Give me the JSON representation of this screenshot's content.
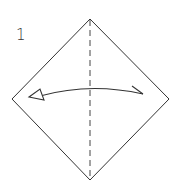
{
  "diagram": {
    "step_number": "1",
    "paper": {
      "shape": "diamond",
      "vertices": {
        "top": [
          90,
          19
        ],
        "right": [
          169,
          99
        ],
        "bottom": [
          90,
          180
        ],
        "left": [
          12,
          99
        ]
      },
      "stroke_color": "#333333"
    },
    "fold_line": {
      "type": "valley-fold",
      "style": "dashed",
      "from": [
        90,
        19
      ],
      "to": [
        90,
        180
      ]
    },
    "arrow": {
      "type": "fold-and-unfold",
      "from": "right",
      "to": "left",
      "left_head": "hollow-triangle",
      "right_head": "half-barb"
    }
  }
}
